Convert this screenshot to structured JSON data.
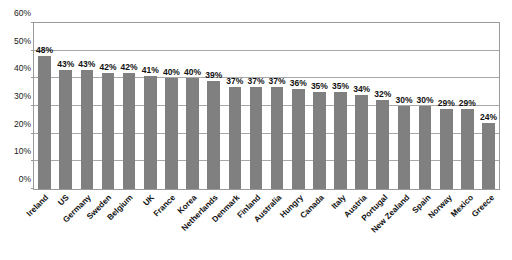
{
  "chart_data": {
    "type": "bar",
    "title": "",
    "xlabel": "",
    "ylabel": "",
    "ylim": [
      0,
      60
    ],
    "ytick_labels": [
      "0%",
      "10%",
      "20%",
      "30%",
      "40%",
      "50%",
      "60%"
    ],
    "ytick_values": [
      0,
      10,
      20,
      30,
      40,
      50,
      60
    ],
    "grid": true,
    "legend": false,
    "value_label_suffix": "%",
    "bar_color": "#808080",
    "categories": [
      "Ireland",
      "US",
      "Germany",
      "Sweden",
      "Belgium",
      "UK",
      "France",
      "Korea",
      "Netherlands",
      "Denmark",
      "Finland",
      "Australia",
      "Hungry",
      "Canada",
      "Italy",
      "Austria",
      "Portugal",
      "New Zealand",
      "Spain",
      "Norway",
      "Mexico",
      "Greece"
    ],
    "values": [
      48,
      43,
      43,
      42,
      42,
      41,
      40,
      40,
      39,
      37,
      37,
      37,
      36,
      35,
      35,
      34,
      32,
      30,
      30,
      29,
      29,
      24
    ],
    "value_labels": [
      "48%",
      "43%",
      "43%",
      "42%",
      "42%",
      "41%",
      "40%",
      "40%",
      "39%",
      "37%",
      "37%",
      "37%",
      "36%",
      "35%",
      "35%",
      "34%",
      "32%",
      "30%",
      "30%",
      "29%",
      "29%",
      "24%"
    ]
  }
}
